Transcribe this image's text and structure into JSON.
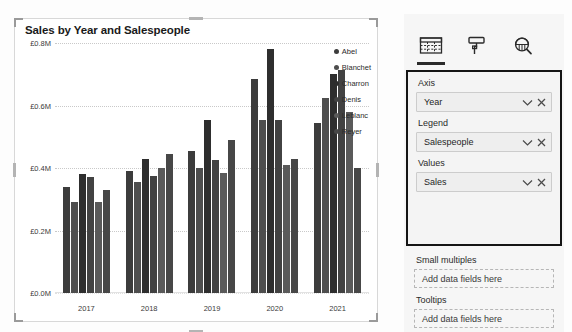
{
  "chart": {
    "title": "Sales by Year and Salespeople",
    "y_ticks": [
      "£0.8M",
      "£0.6M",
      "£0.4M",
      "£0.2M",
      "£0.0M"
    ],
    "x_labels": [
      "2017",
      "2018",
      "2019",
      "2020",
      "2021"
    ],
    "legend_title": "",
    "series_colors": [
      "#3c3c3c",
      "#4e4e4e",
      "#2e2e2e",
      "#424242",
      "#5a5a5a",
      "#474747"
    ]
  },
  "chart_data": {
    "type": "bar",
    "title": "Sales by Year and Salespeople",
    "xlabel": "",
    "ylabel": "",
    "ylim": [
      0,
      0.8
    ],
    "ytick_values": [
      0.8,
      0.6,
      0.4,
      0.2,
      0.0
    ],
    "ytick_labels": [
      "£0.8M",
      "£0.6M",
      "£0.4M",
      "£0.2M",
      "£0.0M"
    ],
    "grid": true,
    "legend_position": "right",
    "units": "£M",
    "categories": [
      "2017",
      "2018",
      "2019",
      "2020",
      "2021"
    ],
    "series": [
      {
        "name": "Abel",
        "color": "#3c3c3c",
        "values": [
          0.34,
          0.39,
          0.455,
          0.685,
          0.545
        ]
      },
      {
        "name": "Blanchet",
        "color": "#4e4e4e",
        "values": [
          0.29,
          0.355,
          0.4,
          0.555,
          0.625
        ]
      },
      {
        "name": "Charron",
        "color": "#2e2e2e",
        "values": [
          0.38,
          0.43,
          0.555,
          0.78,
          0.7
        ]
      },
      {
        "name": "Denis",
        "color": "#424242",
        "values": [
          0.37,
          0.375,
          0.425,
          0.555,
          0.715
        ]
      },
      {
        "name": "Leblanc",
        "color": "#5a5a5a",
        "values": [
          0.29,
          0.4,
          0.385,
          0.41,
          0.58
        ]
      },
      {
        "name": "Reyer",
        "color": "#474747",
        "values": [
          0.33,
          0.445,
          0.49,
          0.43,
          0.4
        ]
      }
    ]
  },
  "viz_pane": {
    "tabs": [
      {
        "name": "fields-tab",
        "icon": "fields-table-icon",
        "active": true
      },
      {
        "name": "format-tab",
        "icon": "paint-roller-icon",
        "active": false
      },
      {
        "name": "analytics-tab",
        "icon": "magnifier-chart-icon",
        "active": false
      }
    ],
    "wells": [
      {
        "title": "Axis",
        "value": "Year",
        "placeholder": null,
        "has_field": true
      },
      {
        "title": "Legend",
        "value": "Salespeople",
        "placeholder": null,
        "has_field": true
      },
      {
        "title": "Values",
        "value": "Sales",
        "placeholder": null,
        "has_field": true
      },
      {
        "title": "Small multiples",
        "value": null,
        "placeholder": "Add data fields here",
        "has_field": false
      },
      {
        "title": "Tooltips",
        "value": null,
        "placeholder": "Add data fields here",
        "has_field": false
      }
    ],
    "field_actions": {
      "expand": "chevron-down-icon",
      "remove": "close-icon"
    }
  }
}
